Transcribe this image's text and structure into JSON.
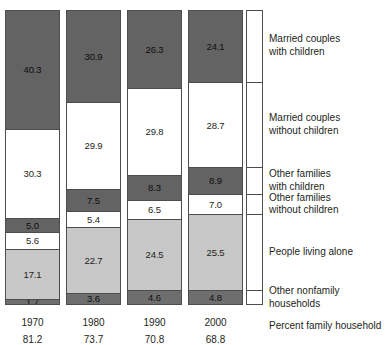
{
  "chart_data": {
    "type": "bar",
    "subtype": "stacked-100-percent",
    "title": "",
    "xlabel": "",
    "ylabel": "",
    "ylim": [
      0,
      100
    ],
    "grid": false,
    "legend_position": "right",
    "categories": [
      "1970",
      "1980",
      "1990",
      "2000"
    ],
    "series": [
      {
        "name": "Married couples with children",
        "values": [
          40.3,
          30.9,
          26.3,
          24.1
        ],
        "color": "#636363"
      },
      {
        "name": "Married couples without children",
        "values": [
          30.3,
          29.9,
          29.8,
          28.7
        ],
        "color": "#ffffff"
      },
      {
        "name": "Other families with children",
        "values": [
          5.0,
          7.5,
          8.3,
          8.9
        ],
        "color": "#636363"
      },
      {
        "name": "Other families without children",
        "values": [
          5.6,
          5.4,
          6.5,
          7.0
        ],
        "color": "#ffffff"
      },
      {
        "name": "People living alone",
        "values": [
          17.1,
          22.7,
          24.5,
          25.5
        ],
        "color": "#c8c8c8"
      },
      {
        "name": "Other nonfamily households",
        "values": [
          1.7,
          3.6,
          4.6,
          4.8
        ],
        "color": "#6e6e6e"
      }
    ],
    "annotations": {
      "row_label": "Percent family household",
      "row_values": [
        81.2,
        73.7,
        70.8,
        68.8
      ]
    }
  },
  "bars": [
    {
      "year": "1970",
      "percent_family_household": "81.2",
      "segments": [
        {
          "label": "40.3",
          "value": 40.3,
          "key": "mc-kids"
        },
        {
          "label": "30.3",
          "value": 30.3,
          "key": "mc-nokids"
        },
        {
          "label": "5.0",
          "value": 5.0,
          "key": "of-kids"
        },
        {
          "label": "5.6",
          "value": 5.6,
          "key": "of-nokids"
        },
        {
          "label": "17.1",
          "value": 17.1,
          "key": "alone"
        },
        {
          "label": "1.7",
          "value": 1.7,
          "key": "nonfamily"
        }
      ]
    },
    {
      "year": "1980",
      "percent_family_household": "73.7",
      "segments": [
        {
          "label": "30.9",
          "value": 30.9,
          "key": "mc-kids"
        },
        {
          "label": "29.9",
          "value": 29.9,
          "key": "mc-nokids"
        },
        {
          "label": "7.5",
          "value": 7.5,
          "key": "of-kids"
        },
        {
          "label": "5.4",
          "value": 5.4,
          "key": "of-nokids"
        },
        {
          "label": "22.7",
          "value": 22.7,
          "key": "alone"
        },
        {
          "label": "3.6",
          "value": 3.6,
          "key": "nonfamily"
        }
      ]
    },
    {
      "year": "1990",
      "percent_family_household": "70.8",
      "segments": [
        {
          "label": "26.3",
          "value": 26.3,
          "key": "mc-kids"
        },
        {
          "label": "29.8",
          "value": 29.8,
          "key": "mc-nokids"
        },
        {
          "label": "8.3",
          "value": 8.3,
          "key": "of-kids"
        },
        {
          "label": "6.5",
          "value": 6.5,
          "key": "of-nokids"
        },
        {
          "label": "24.5",
          "value": 24.5,
          "key": "alone"
        },
        {
          "label": "4.6",
          "value": 4.6,
          "key": "nonfamily"
        }
      ]
    },
    {
      "year": "2000",
      "percent_family_household": "68.8",
      "segments": [
        {
          "label": "24.1",
          "value": 24.1,
          "key": "mc-kids"
        },
        {
          "label": "28.7",
          "value": 28.7,
          "key": "mc-nokids"
        },
        {
          "label": "8.9",
          "value": 8.9,
          "key": "of-kids"
        },
        {
          "label": "7.0",
          "value": 7.0,
          "key": "of-nokids"
        },
        {
          "label": "25.5",
          "value": 25.5,
          "key": "alone"
        },
        {
          "label": "4.8",
          "value": 4.8,
          "key": "nonfamily"
        }
      ]
    }
  ],
  "legend": {
    "entries": [
      {
        "line1": "Married couples",
        "line2": "with children",
        "key": "mc-kids"
      },
      {
        "line1": "Married couples",
        "line2": "without children",
        "key": "mc-nokids"
      },
      {
        "line1": "Other families",
        "line2": "with children",
        "key": "of-kids"
      },
      {
        "line1": "Other families",
        "line2": "without children",
        "key": "of-nokids"
      },
      {
        "line1": "People living alone",
        "line2": "",
        "key": "alone"
      },
      {
        "line1": "Other nonfamily",
        "line2": "households",
        "key": "nonfamily"
      }
    ]
  },
  "footnote": {
    "text": "Percent family household"
  },
  "colors": {
    "dark_gray": "#636363",
    "mid_gray": "#6e6e6e",
    "light_gray": "#c8c8c8",
    "white": "#ffffff",
    "outline": "#4d4d4d",
    "text": "#231f20"
  }
}
